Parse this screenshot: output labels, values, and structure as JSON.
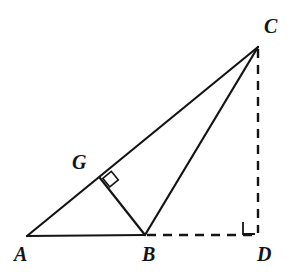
{
  "figure": {
    "background_color": "#ffffff",
    "stroke_color": "#141414",
    "stroke_width": 2,
    "dash_pattern": "9 7",
    "width": 305,
    "height": 272
  },
  "points": {
    "A": {
      "label": "A",
      "x": 27,
      "y": 236,
      "label_x": 14,
      "label_y": 244
    },
    "B": {
      "label": "B",
      "x": 145,
      "y": 235,
      "label_x": 142,
      "label_y": 244
    },
    "C": {
      "label": "C",
      "x": 258,
      "y": 47,
      "label_x": 264,
      "label_y": 16
    },
    "D": {
      "label": "D",
      "x": 258,
      "y": 235,
      "label_x": 257,
      "label_y": 244
    },
    "G": {
      "label": "G",
      "x": 100,
      "y": 178,
      "label_x": 72,
      "label_y": 152
    }
  },
  "segments": [
    {
      "name": "segment-AB",
      "from": "A",
      "to": "B",
      "style": "solid"
    },
    {
      "name": "segment-AC",
      "from": "A",
      "to": "C",
      "style": "solid"
    },
    {
      "name": "segment-BC",
      "from": "B",
      "to": "C",
      "style": "solid"
    },
    {
      "name": "segment-BG",
      "from": "G",
      "to": "B",
      "style": "solid"
    },
    {
      "name": "segment-BD",
      "from": "B",
      "to": "D",
      "style": "dashed"
    },
    {
      "name": "segment-CD",
      "from": "C",
      "to": "D",
      "style": "dashed"
    }
  ],
  "right_angle_marks": [
    {
      "name": "right-angle-at-G",
      "at": "G",
      "size": 11,
      "rotation_deg": -38
    },
    {
      "name": "right-angle-at-D",
      "at": "D",
      "size": 12,
      "orientation": "up-left"
    }
  ]
}
